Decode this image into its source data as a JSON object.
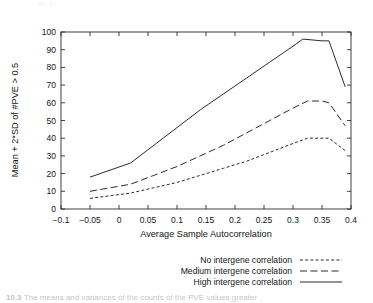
{
  "figure": {
    "ghost_text_top": "σ²ⱼ                     τᵢⱼ",
    "caption_prefix": "10.3",
    "caption_text": "The means and variances of the counts of the PVE values greater"
  },
  "chart_data": {
    "type": "line",
    "title": "",
    "xlabel": "Average Sample Autocorrelation",
    "ylabel": "Mean + 2*SD of #PVE > 0.5",
    "xlim": [
      -0.1,
      0.4
    ],
    "ylim": [
      0,
      100
    ],
    "xticks": [
      -0.1,
      -0.05,
      0,
      0.05,
      0.1,
      0.15,
      0.2,
      0.25,
      0.3,
      0.35,
      0.4
    ],
    "xticklabels": [
      "−0.1",
      "−0.05",
      "0",
      "0.05",
      "0.1",
      "0.15",
      "0.2",
      "0.25",
      "0.3",
      "0.35",
      "0.4"
    ],
    "yticks": [
      0,
      10,
      20,
      30,
      40,
      50,
      60,
      70,
      80,
      90,
      100
    ],
    "yticklabels": [
      "0",
      "10",
      "20",
      "30",
      "40",
      "50",
      "60",
      "70",
      "80",
      "90",
      "100"
    ],
    "grid": false,
    "legend_position": "below-right",
    "series": [
      {
        "name": "No intergene correlation",
        "style": "dotted",
        "dasharray": "3,2.2",
        "x": [
          -0.05,
          0.02,
          0.06,
          0.1,
          0.14,
          0.18,
          0.22,
          0.26,
          0.3,
          0.325,
          0.35,
          0.362,
          0.39
        ],
        "y": [
          6,
          9,
          12,
          15,
          19,
          23,
          27,
          32,
          37,
          40,
          40,
          40,
          33
        ]
      },
      {
        "name": "Medium intergene correlation",
        "style": "dashed",
        "dasharray": "7,3.5",
        "x": [
          -0.05,
          0.02,
          0.06,
          0.1,
          0.14,
          0.18,
          0.22,
          0.26,
          0.3,
          0.325,
          0.35,
          0.362,
          0.39
        ],
        "y": [
          10,
          14,
          19,
          24,
          30,
          36,
          43,
          50,
          57,
          61,
          61,
          60,
          47
        ]
      },
      {
        "name": "High intergene correlation",
        "style": "solid",
        "dasharray": "",
        "x": [
          -0.05,
          0.02,
          0.06,
          0.1,
          0.14,
          0.18,
          0.22,
          0.26,
          0.3,
          0.317,
          0.35,
          0.362,
          0.39
        ],
        "y": [
          18,
          26,
          36,
          46,
          56,
          65,
          74,
          83,
          92,
          96,
          95,
          95,
          69
        ]
      }
    ]
  },
  "legend": {
    "entries": [
      {
        "label": "No intergene correlation",
        "style": "dotted"
      },
      {
        "label": "Medium intergene correlation",
        "style": "dashed"
      },
      {
        "label": "High intergene correlation",
        "style": "solid"
      }
    ]
  }
}
